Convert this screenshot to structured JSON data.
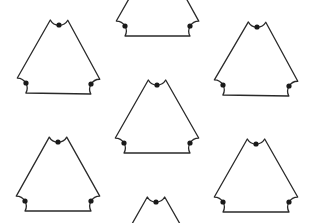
{
  "diagram": {
    "colors": {
      "background": "#ffffff",
      "stroke": "#2a2a2a",
      "dot": "#1a1a1a"
    },
    "dot_radius": 2.6,
    "corner_offset": 10,
    "shapes": [
      {
        "id": "triangle-top-left",
        "dots": [
          [
            59,
            25
          ],
          [
            26,
            83
          ],
          [
            91,
            84
          ]
        ]
      },
      {
        "id": "triangle-top-right",
        "dots": [
          [
            257,
            27
          ],
          [
            223,
            85
          ],
          [
            289,
            86
          ]
        ]
      },
      {
        "id": "triangle-center",
        "dots": [
          [
            157,
            85
          ],
          [
            124,
            143
          ],
          [
            190,
            143
          ]
        ]
      },
      {
        "id": "triangle-bottom-left",
        "dots": [
          [
            58,
            142
          ],
          [
            25,
            201
          ],
          [
            91,
            201
          ]
        ]
      },
      {
        "id": "triangle-bottom-right",
        "dots": [
          [
            256,
            144
          ],
          [
            223,
            202
          ],
          [
            289,
            202
          ]
        ]
      },
      {
        "id": "triangle-top-center-partial",
        "dots": [
          [
            158,
            -32
          ],
          [
            125,
            26
          ],
          [
            190,
            26
          ]
        ]
      },
      {
        "id": "triangle-bottom-center-partial",
        "dots": [
          [
            156,
            202
          ],
          [
            123,
            260
          ],
          [
            189,
            260
          ]
        ]
      }
    ]
  }
}
